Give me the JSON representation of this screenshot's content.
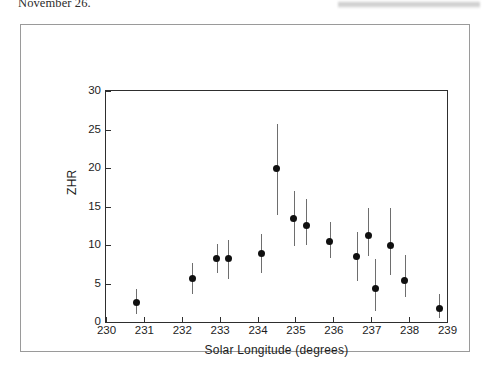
{
  "page": {
    "body_text": "November 26."
  },
  "redaction": {
    "name": "blurred-bar"
  },
  "chart_data": {
    "type": "scatter",
    "title": "",
    "subtitle": "",
    "xlabel": "Solar Longitude (degrees)",
    "ylabel": "ZHR",
    "xlim": [
      230,
      239
    ],
    "ylim": [
      0,
      30
    ],
    "xticks": [
      230,
      231,
      232,
      233,
      234,
      235,
      236,
      237,
      238,
      239
    ],
    "yticks": [
      0,
      5,
      10,
      15,
      20,
      25,
      30
    ],
    "grid": false,
    "legend": "none",
    "marker_color": "#101010",
    "errorbar_color": "#6e6e6e",
    "axis_color": "#2e2e2e",
    "error_type": "vertical error bars",
    "points": [
      {
        "x": 230.8,
        "y": 2.5,
        "yerr_low": 1.1,
        "yerr_high": 4.3
      },
      {
        "x": 232.28,
        "y": 5.6,
        "yerr_low": 3.6,
        "yerr_high": 7.6
      },
      {
        "x": 232.92,
        "y": 8.2,
        "yerr_low": 6.4,
        "yerr_high": 10.1
      },
      {
        "x": 233.22,
        "y": 8.2,
        "yerr_low": 5.6,
        "yerr_high": 10.6
      },
      {
        "x": 234.1,
        "y": 8.9,
        "yerr_low": 6.3,
        "yerr_high": 11.4
      },
      {
        "x": 234.5,
        "y": 19.9,
        "yerr_low": 13.9,
        "yerr_high": 25.7
      },
      {
        "x": 234.95,
        "y": 13.4,
        "yerr_low": 9.9,
        "yerr_high": 17.0
      },
      {
        "x": 235.28,
        "y": 12.5,
        "yerr_low": 10.0,
        "yerr_high": 16.0
      },
      {
        "x": 235.9,
        "y": 10.5,
        "yerr_low": 8.3,
        "yerr_high": 13.0
      },
      {
        "x": 236.62,
        "y": 8.5,
        "yerr_low": 5.3,
        "yerr_high": 11.7
      },
      {
        "x": 236.92,
        "y": 11.2,
        "yerr_low": 8.6,
        "yerr_high": 14.8
      },
      {
        "x": 237.1,
        "y": 4.3,
        "yerr_low": 1.4,
        "yerr_high": 8.2
      },
      {
        "x": 237.5,
        "y": 10.0,
        "yerr_low": 6.1,
        "yerr_high": 14.8
      },
      {
        "x": 237.88,
        "y": 5.4,
        "yerr_low": 3.2,
        "yerr_high": 8.7
      },
      {
        "x": 238.8,
        "y": 1.8,
        "yerr_low": 0.5,
        "yerr_high": 3.6
      }
    ]
  }
}
